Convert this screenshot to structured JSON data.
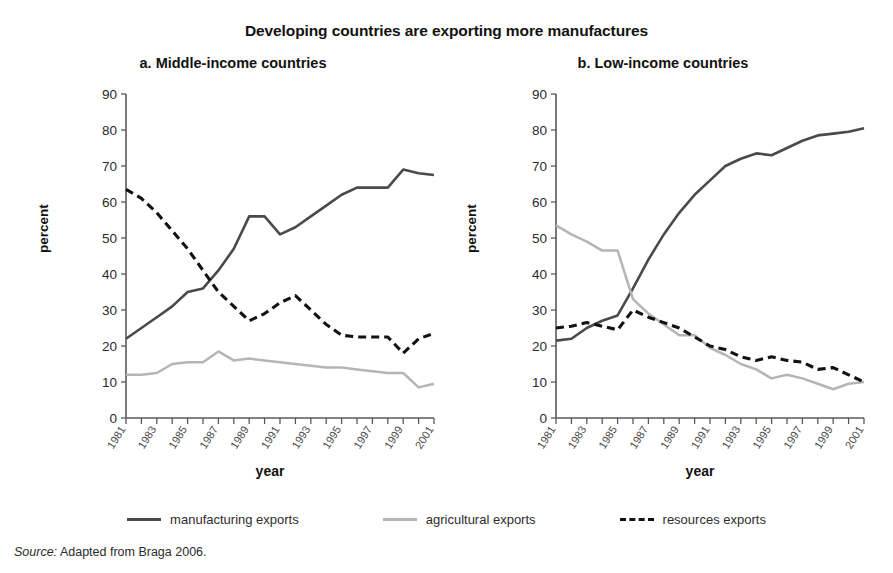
{
  "title": "Developing countries are exporting more manufactures",
  "source": {
    "label": "Source:",
    "text": "Adapted from Braga 2006."
  },
  "legend": {
    "items": [
      {
        "label": "manufacturing exports",
        "color": "#4a4a4a",
        "style": "solid"
      },
      {
        "label": "agricultural exports",
        "color": "#b5b5b5",
        "style": "solid"
      },
      {
        "label": "resources exports",
        "color": "#121212",
        "style": "dashed"
      }
    ]
  },
  "axes": {
    "ylabel": "percent",
    "xlabel": "year",
    "yticks": [
      0,
      10,
      20,
      30,
      40,
      50,
      60,
      70,
      80,
      90
    ],
    "ylim": [
      0,
      90
    ],
    "xticks_all": [
      1981,
      1982,
      1983,
      1984,
      1985,
      1986,
      1987,
      1988,
      1989,
      1990,
      1991,
      1992,
      1993,
      1994,
      1995,
      1996,
      1997,
      1998,
      1999,
      2000,
      2001
    ],
    "xticks_labeled": [
      1981,
      1983,
      1985,
      1987,
      1989,
      1991,
      1993,
      1995,
      1997,
      1999,
      2001
    ]
  },
  "chart_data": [
    {
      "id": "panel-a",
      "type": "line",
      "title": "a. Middle-income countries",
      "xlabel": "year",
      "ylabel": "percent",
      "ylim": [
        0,
        90
      ],
      "grid": false,
      "legend_position": "bottom-shared",
      "x": [
        1981,
        1982,
        1983,
        1984,
        1985,
        1986,
        1987,
        1988,
        1989,
        1990,
        1991,
        1992,
        1993,
        1994,
        1995,
        1996,
        1997,
        1998,
        1999,
        2000,
        2001
      ],
      "series": [
        {
          "name": "manufacturing exports",
          "color": "#4a4a4a",
          "style": "solid",
          "values": [
            22,
            25,
            28,
            31,
            35,
            36,
            41,
            47,
            56,
            56,
            51,
            53,
            56,
            59,
            62,
            64,
            64,
            64,
            69,
            68,
            67.5
          ]
        },
        {
          "name": "agricultural exports",
          "color": "#b5b5b5",
          "style": "solid",
          "values": [
            12,
            12,
            12.5,
            15,
            15.5,
            15.5,
            18.5,
            16,
            16.5,
            16,
            15.5,
            15,
            14.5,
            14,
            14,
            13.5,
            13,
            12.5,
            12.5,
            8.5,
            9.5
          ]
        },
        {
          "name": "resources exports",
          "color": "#121212",
          "style": "dashed",
          "values": [
            63.5,
            61,
            57,
            52,
            47,
            41,
            35,
            31,
            27,
            29,
            32,
            34,
            30,
            26,
            23,
            22.5,
            22.5,
            22.5,
            18,
            22,
            23.5
          ]
        }
      ]
    },
    {
      "id": "panel-b",
      "type": "line",
      "title": "b. Low-income countries",
      "xlabel": "year",
      "ylabel": "percent",
      "ylim": [
        0,
        90
      ],
      "grid": false,
      "legend_position": "bottom-shared",
      "x": [
        1981,
        1982,
        1983,
        1984,
        1985,
        1986,
        1987,
        1988,
        1989,
        1990,
        1991,
        1992,
        1993,
        1994,
        1995,
        1996,
        1997,
        1998,
        1999,
        2000,
        2001
      ],
      "series": [
        {
          "name": "manufacturing exports",
          "color": "#4a4a4a",
          "style": "solid",
          "values": [
            21.5,
            22,
            25,
            27,
            28.5,
            36,
            44,
            51,
            57,
            62,
            66,
            70,
            72,
            73.5,
            73,
            75,
            77,
            78.5,
            79,
            79.5,
            80.5
          ]
        },
        {
          "name": "agricultural exports",
          "color": "#b5b5b5",
          "style": "solid",
          "values": [
            53.5,
            51,
            49,
            46.5,
            46.5,
            33,
            29,
            26,
            23,
            23,
            19.5,
            17.5,
            15,
            13.5,
            11,
            12,
            11,
            9.5,
            8,
            9.5,
            10
          ]
        },
        {
          "name": "resources exports",
          "color": "#121212",
          "style": "dashed",
          "values": [
            25,
            25.5,
            26.5,
            25.5,
            24.5,
            30,
            28,
            26.5,
            25,
            22.5,
            20,
            19,
            17,
            16,
            17,
            16,
            15.5,
            13.5,
            14,
            12,
            10
          ]
        }
      ]
    }
  ]
}
